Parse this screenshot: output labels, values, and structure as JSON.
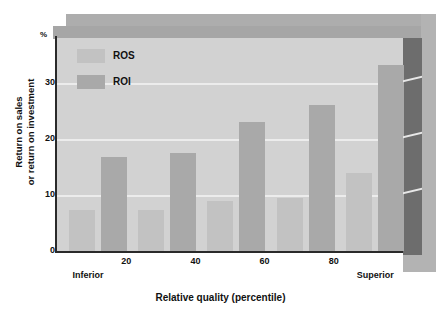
{
  "chart_data": {
    "type": "bar",
    "title": "",
    "xlabel": "Relative quality (percentile)",
    "ylabel_line1": "Return on sales",
    "ylabel_line2": "or return on investment",
    "unit_label": "%",
    "x": [
      10,
      30,
      50,
      70,
      90
    ],
    "xtick_labels": [
      "20",
      "40",
      "60",
      "80"
    ],
    "xtick_values": [
      20,
      40,
      60,
      80
    ],
    "x_end_labels": {
      "low": "Inferior",
      "high": "Superior"
    },
    "ytick_labels": [
      "0",
      "10",
      "20",
      "30"
    ],
    "ytick_values": [
      0,
      10,
      20,
      30
    ],
    "ylim": [
      0,
      38
    ],
    "xlim": [
      0,
      100
    ],
    "grid": true,
    "legend_position": "top-left",
    "series": [
      {
        "name": "ROS",
        "color": "#c2c2c2",
        "values": [
          7.4,
          7.4,
          9.0,
          9.4,
          14.0
        ]
      },
      {
        "name": "ROI",
        "color": "#a9a9a9",
        "values": [
          16.8,
          17.4,
          23.0,
          26.0,
          33.2
        ]
      }
    ]
  },
  "legend": {
    "items": [
      {
        "label": "ROS",
        "color": "#c2c2c2"
      },
      {
        "label": "ROI",
        "color": "#a9a9a9"
      }
    ]
  },
  "colors": {
    "plot_background": "#d2d2d2",
    "gridline": "#ececec",
    "axis": "#2a2a2a",
    "wall_top": "#a6a6a6",
    "wall_right": "#6d6d6d",
    "shell_outer": "#b3b3b3",
    "ros": "#c2c2c2",
    "roi": "#a9a9a9",
    "page_background": "#ffffff"
  }
}
